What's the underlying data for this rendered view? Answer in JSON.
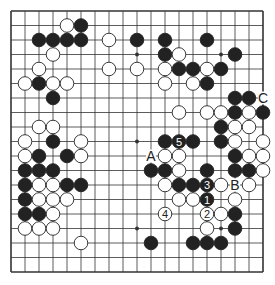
{
  "diagram": {
    "type": "go-board",
    "size": 19,
    "colors": {
      "background": "#ffffff",
      "line": "#333333",
      "black_stone": "#222222",
      "white_stone": "#ffffff",
      "stone_outline": "#222222"
    },
    "hoshi": [
      [
        3,
        3
      ],
      [
        3,
        9
      ],
      [
        3,
        15
      ],
      [
        9,
        3
      ],
      [
        9,
        9
      ],
      [
        9,
        15
      ],
      [
        15,
        3
      ],
      [
        15,
        9
      ],
      [
        15,
        15
      ]
    ],
    "black": [
      [
        1,
        5
      ],
      [
        2,
        2
      ],
      [
        2,
        3
      ],
      [
        2,
        4
      ],
      [
        2,
        5
      ],
      [
        2,
        9
      ],
      [
        2,
        11
      ],
      [
        2,
        14
      ],
      [
        3,
        11
      ],
      [
        3,
        16
      ],
      [
        4,
        12
      ],
      [
        4,
        13
      ],
      [
        4,
        15
      ],
      [
        5,
        2
      ],
      [
        5,
        14
      ],
      [
        6,
        3
      ],
      [
        6,
        16
      ],
      [
        6,
        17
      ],
      [
        7,
        16
      ],
      [
        7,
        18
      ],
      [
        8,
        15
      ],
      [
        9,
        3
      ],
      [
        9,
        11
      ],
      [
        9,
        13
      ],
      [
        9,
        15
      ],
      [
        10,
        2
      ],
      [
        10,
        4
      ],
      [
        10,
        16
      ],
      [
        11,
        1
      ],
      [
        11,
        2
      ],
      [
        11,
        3
      ],
      [
        11,
        10
      ],
      [
        11,
        11
      ],
      [
        11,
        14
      ],
      [
        11,
        16
      ],
      [
        11,
        17
      ],
      [
        12,
        1
      ],
      [
        12,
        4
      ],
      [
        12,
        5
      ],
      [
        12,
        12
      ],
      [
        12,
        13
      ],
      [
        13,
        1
      ],
      [
        14,
        1
      ],
      [
        14,
        2
      ],
      [
        14,
        16
      ],
      [
        15,
        16
      ],
      [
        16,
        10
      ],
      [
        16,
        13
      ],
      [
        16,
        14
      ],
      [
        16,
        15
      ]
    ],
    "white": [
      [
        1,
        4
      ],
      [
        2,
        7
      ],
      [
        3,
        3
      ],
      [
        3,
        12
      ],
      [
        4,
        2
      ],
      [
        4,
        7
      ],
      [
        4,
        9
      ],
      [
        4,
        11
      ],
      [
        4,
        14
      ],
      [
        5,
        1
      ],
      [
        5,
        3
      ],
      [
        5,
        4
      ],
      [
        5,
        11
      ],
      [
        5,
        13
      ],
      [
        7,
        12
      ],
      [
        7,
        14
      ],
      [
        7,
        15
      ],
      [
        7,
        17
      ],
      [
        8,
        2
      ],
      [
        8,
        3
      ],
      [
        8,
        16
      ],
      [
        8,
        17
      ],
      [
        9,
        1
      ],
      [
        9,
        5
      ],
      [
        9,
        16
      ],
      [
        9,
        18
      ],
      [
        10,
        1
      ],
      [
        10,
        5
      ],
      [
        10,
        11
      ],
      [
        10,
        12
      ],
      [
        10,
        17
      ],
      [
        10,
        18
      ],
      [
        11,
        12
      ],
      [
        11,
        18
      ],
      [
        12,
        2
      ],
      [
        12,
        3
      ],
      [
        12,
        11
      ],
      [
        12,
        15
      ],
      [
        12,
        17
      ],
      [
        13,
        2
      ],
      [
        13,
        3
      ],
      [
        13,
        4
      ],
      [
        13,
        12
      ],
      [
        13,
        13
      ],
      [
        13,
        16
      ],
      [
        14,
        3
      ],
      [
        14,
        15
      ],
      [
        15,
        1
      ],
      [
        15,
        2
      ],
      [
        15,
        3
      ],
      [
        15,
        14
      ],
      [
        16,
        5
      ]
    ],
    "numbered_moves": [
      {
        "row": 13,
        "col": 14,
        "color": "black",
        "label": "1"
      },
      {
        "row": 14,
        "col": 14,
        "color": "white",
        "label": "2"
      },
      {
        "row": 12,
        "col": 14,
        "color": "black",
        "label": "3"
      },
      {
        "row": 14,
        "col": 11,
        "color": "white",
        "label": "4"
      },
      {
        "row": 9,
        "col": 12,
        "color": "black",
        "label": "5"
      }
    ],
    "letter_marks": [
      {
        "row": 10,
        "col": 10,
        "label": "A"
      },
      {
        "row": 12,
        "col": 16,
        "label": "B"
      },
      {
        "row": 6,
        "col": 18,
        "label": "C"
      }
    ]
  }
}
